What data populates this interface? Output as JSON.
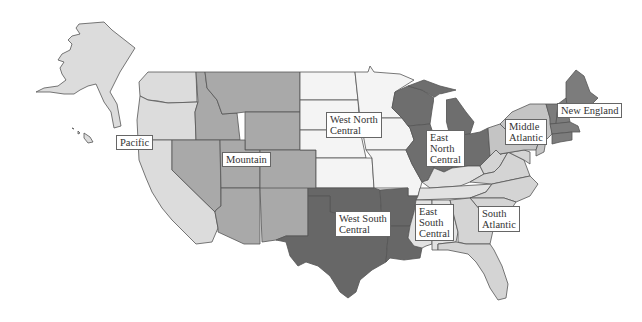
{
  "colors": {
    "background": "#ffffff",
    "border": "#555555",
    "pacific": "#dcdcdc",
    "mountain": "#a9a9a9",
    "west_north_central": "#f4f4f4",
    "east_north_central": "#6e6e6e",
    "west_south_central": "#676767",
    "east_south_central": "#e2e2e2",
    "south_atlantic": "#d4d4d4",
    "middle_atlantic": "#c4c4c4",
    "new_england": "#7c7c7c"
  },
  "regions": [
    {
      "id": "pacific",
      "label": "Pacific",
      "states": [
        "Alaska",
        "Hawaii",
        "Washington",
        "Oregon",
        "California"
      ]
    },
    {
      "id": "mountain",
      "label": "Mountain",
      "states": [
        "Montana",
        "Idaho",
        "Wyoming",
        "Nevada",
        "Utah",
        "Colorado",
        "Arizona",
        "New Mexico"
      ]
    },
    {
      "id": "west_north_central",
      "label": "West North\nCentral",
      "states": [
        "North Dakota",
        "South Dakota",
        "Nebraska",
        "Kansas",
        "Minnesota",
        "Iowa",
        "Missouri"
      ]
    },
    {
      "id": "east_north_central",
      "label": "East\nNorth\nCentral",
      "states": [
        "Wisconsin",
        "Michigan",
        "Illinois",
        "Indiana",
        "Ohio"
      ]
    },
    {
      "id": "west_south_central",
      "label": "West South\nCentral",
      "states": [
        "Oklahoma",
        "Texas",
        "Arkansas",
        "Louisiana"
      ]
    },
    {
      "id": "east_south_central",
      "label": "East\nSouth\nCentral",
      "states": [
        "Kentucky",
        "Tennessee",
        "Mississippi",
        "Alabama"
      ]
    },
    {
      "id": "south_atlantic",
      "label": "South\nAtlantic",
      "states": [
        "West Virginia",
        "Virginia",
        "North Carolina",
        "South Carolina",
        "Georgia",
        "Florida",
        "Maryland",
        "Delaware"
      ]
    },
    {
      "id": "middle_atlantic",
      "label": "Middle\nAtlantic",
      "states": [
        "New York",
        "Pennsylvania",
        "New Jersey"
      ]
    },
    {
      "id": "new_england",
      "label": "New England",
      "states": [
        "Maine",
        "New Hampshire",
        "Vermont",
        "Massachusetts",
        "Connecticut",
        "Rhode Island"
      ]
    }
  ],
  "labels": {
    "pacific": "Pacific",
    "mountain": "Mountain",
    "west_north_central": "West North\nCentral",
    "east_north_central": "East\nNorth\nCentral",
    "west_south_central": "West South\nCentral",
    "east_south_central": "East\nSouth\nCentral",
    "south_atlantic": "South\nAtlantic",
    "middle_atlantic": "Middle\nAtlantic",
    "new_england": "New England"
  }
}
